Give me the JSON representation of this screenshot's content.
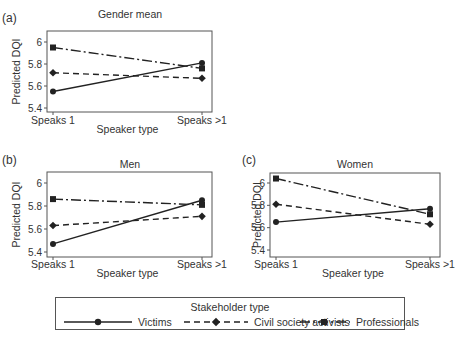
{
  "chart_data": [
    {
      "type": "line",
      "panel_label": "(a)",
      "title": "Gender mean",
      "xlabel": "Speaker type",
      "ylabel": "Predicted DQI",
      "categories": [
        "Speaks 1",
        "Speaks >1"
      ],
      "yticks": [
        5.4,
        5.6,
        5.8,
        6
      ],
      "ytick_labels": [
        "5.4",
        "5.6",
        "5.8",
        "6"
      ],
      "ylim": [
        5.37,
        6.08
      ],
      "series": [
        {
          "name": "Victims",
          "values": [
            5.55,
            5.81
          ]
        },
        {
          "name": "Civil society activists",
          "values": [
            5.72,
            5.67
          ]
        },
        {
          "name": "Professionals",
          "values": [
            5.95,
            5.76
          ]
        }
      ]
    },
    {
      "type": "line",
      "panel_label": "(b)",
      "title": "Men",
      "xlabel": "Speaker type",
      "ylabel": "Predicted DQI",
      "categories": [
        "Speaks 1",
        "Speaks >1"
      ],
      "yticks": [
        5.4,
        5.6,
        5.8,
        6
      ],
      "ytick_labels": [
        "5.4",
        "5.6",
        "5.8",
        "6"
      ],
      "ylim": [
        5.37,
        6.08
      ],
      "series": [
        {
          "name": "Victims",
          "values": [
            5.47,
            5.85
          ]
        },
        {
          "name": "Civil society activists",
          "values": [
            5.63,
            5.71
          ]
        },
        {
          "name": "Professionals",
          "values": [
            5.86,
            5.81
          ]
        }
      ]
    },
    {
      "type": "line",
      "panel_label": "(c)",
      "title": "Women",
      "xlabel": "Speaker type",
      "ylabel": "Predicted DQI",
      "categories": [
        "Speaks 1",
        "Speaks >1"
      ],
      "yticks": [
        5.4,
        5.6,
        5.8,
        6
      ],
      "ytick_labels": [
        "5.4",
        "5.6",
        "5.8",
        "6"
      ],
      "ylim": [
        5.37,
        6.08
      ],
      "series": [
        {
          "name": "Victims",
          "values": [
            5.65,
            5.77
          ]
        },
        {
          "name": "Civil society activists",
          "values": [
            5.81,
            5.63
          ]
        },
        {
          "name": "Professionals",
          "values": [
            6.04,
            5.72
          ]
        }
      ]
    }
  ],
  "legend": {
    "title": "Stakeholder type",
    "position": "bottom-center",
    "items": [
      {
        "name": "Victims",
        "line": "solid",
        "marker": "circle"
      },
      {
        "name": "Civil society activists",
        "line": "dashed",
        "marker": "diamond"
      },
      {
        "name": "Professionals",
        "line": "dash-dot",
        "marker": "square"
      }
    ]
  },
  "style": {
    "line_color": "#222222",
    "frame_color": "#555555",
    "text_color": "#333333"
  }
}
